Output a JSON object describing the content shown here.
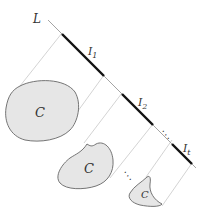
{
  "diagram": {
    "line_label": "L",
    "intervals": [
      {
        "label": "I",
        "sub": "1"
      },
      {
        "label": "I",
        "sub": "2"
      },
      {
        "label": "I",
        "sub": "t"
      }
    ],
    "shape_label": "C",
    "ellipsis_line": "⋱",
    "ellipsis_shapes": "⋱",
    "colors": {
      "line": "#9a9a9a",
      "interval": "#111111",
      "projection": "#c8c8c8",
      "shape_fill": "#e6e6e6",
      "shape_stroke": "#666666"
    }
  }
}
